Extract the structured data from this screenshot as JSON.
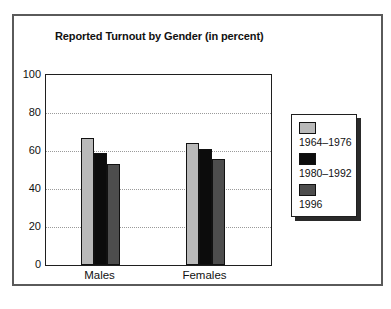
{
  "chart_data": {
    "type": "bar",
    "title": "Reported Turnout by Gender (in percent)",
    "categories": [
      "Males",
      "Females"
    ],
    "series": [
      {
        "name": "1964–1976",
        "color": "#b9b9b9",
        "values": [
          67,
          64
        ]
      },
      {
        "name": "1980–1992",
        "color": "#0c0c0c",
        "values": [
          59,
          61
        ]
      },
      {
        "name": "1996",
        "color": "#4d4d4d",
        "values": [
          53,
          56
        ]
      }
    ],
    "xlabel": "",
    "ylabel": "",
    "ylim": [
      0,
      100
    ],
    "yticks": [
      0,
      20,
      40,
      60,
      80,
      100
    ],
    "grid": "horizontal-dotted",
    "legend_position": "right",
    "legend_entries": [
      "1964–1976",
      "1980–1992",
      "1996"
    ]
  },
  "colors": {
    "frame_border": "#5a5a5a",
    "plot_border": "#1f1f1f",
    "gridline": "#9a9a9a",
    "legend_shadow": "#2a2a2a",
    "text": "#111111",
    "background": "#ffffff",
    "bar_outline": "#111111"
  }
}
